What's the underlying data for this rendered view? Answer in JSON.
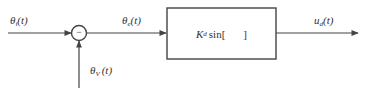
{
  "diagram": {
    "type": "block-diagram",
    "colors": {
      "line": "#444444",
      "text": "#333333",
      "background": "#ffffff"
    },
    "input_signal": {
      "symbol": "θ",
      "subscript": "i",
      "arg": "(t)"
    },
    "feedback_signal": {
      "symbol": "θ",
      "subscript": "V",
      "arg": "(t)"
    },
    "error_signal": {
      "symbol": "θ",
      "subscript": "e",
      "arg": "(t)"
    },
    "output_signal": {
      "symbol": "u",
      "subscript": "d",
      "arg": "(t)"
    },
    "summing_junction": {
      "sign": "−"
    },
    "block": {
      "gain": "K",
      "gain_subscript": "d",
      "function": "sin[",
      "close": "]"
    }
  }
}
